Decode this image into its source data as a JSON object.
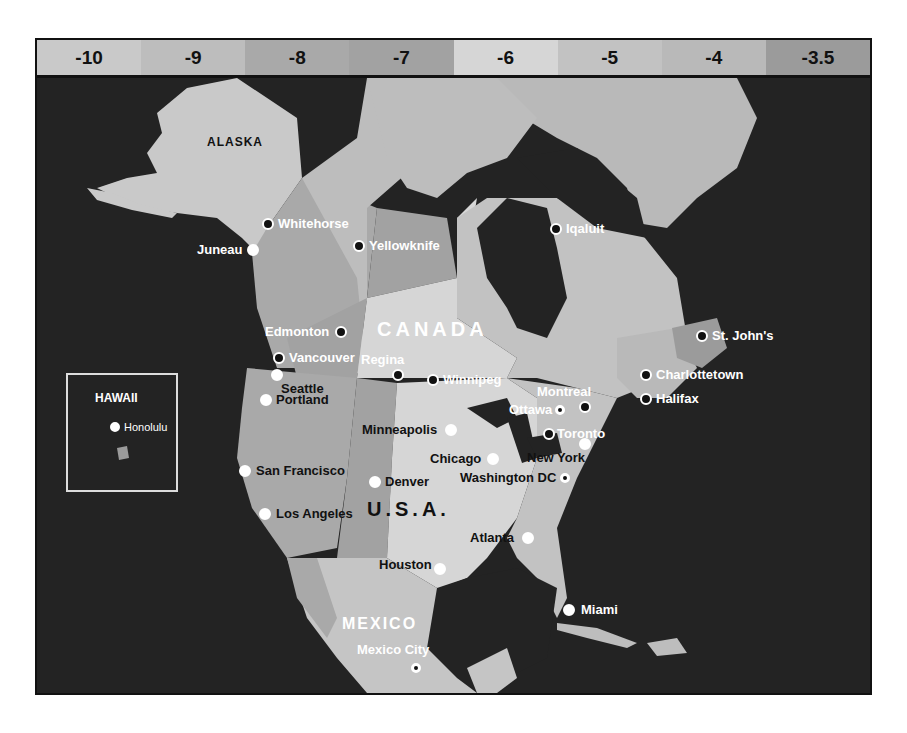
{
  "legend": {
    "title": "UTC offset (hours)",
    "bands": [
      {
        "label": "-10",
        "color": "#c9c9c9"
      },
      {
        "label": "-9",
        "color": "#bdbdbd"
      },
      {
        "label": "-8",
        "color": "#a9a9a9"
      },
      {
        "label": "-7",
        "color": "#a2a2a2"
      },
      {
        "label": "-6",
        "color": "#d6d6d6"
      },
      {
        "label": "-5",
        "color": "#c2c2c2"
      },
      {
        "label": "-4",
        "color": "#b9b9b9"
      },
      {
        "label": "-3.5",
        "color": "#9b9b9b"
      }
    ]
  },
  "colors": {
    "ocean": "#232323",
    "zone_alaska": "#bdbdbd",
    "zone_pacific": "#a9a9a9",
    "zone_mountain": "#a2a2a2",
    "zone_central": "#d6d6d6",
    "zone_central_us": "#c5c5c5",
    "zone_eastern": "#c2c2c2",
    "zone_atlantic": "#b9b9b9",
    "zone_newfoundland": "#9b9b9b"
  },
  "regions": {
    "alaska": "ALASKA",
    "canada": "CANADA",
    "usa": "U.S.A.",
    "mexico": "MEXICO",
    "hawaii": "HAWAII"
  },
  "cities": [
    {
      "name": "Whitehorse"
    },
    {
      "name": "Juneau"
    },
    {
      "name": "Yellowknife"
    },
    {
      "name": "Iqaluit"
    },
    {
      "name": "Edmonton"
    },
    {
      "name": "Vancouver"
    },
    {
      "name": "Regina"
    },
    {
      "name": "Winnipeg"
    },
    {
      "name": "Seattle"
    },
    {
      "name": "Portland"
    },
    {
      "name": "St. John's"
    },
    {
      "name": "Charlottetown"
    },
    {
      "name": "Halifax"
    },
    {
      "name": "Montreal"
    },
    {
      "name": "Ottawa"
    },
    {
      "name": "Toronto"
    },
    {
      "name": "Minneapolis"
    },
    {
      "name": "Chicago"
    },
    {
      "name": "New York"
    },
    {
      "name": "Washington DC"
    },
    {
      "name": "San Francisco"
    },
    {
      "name": "Denver"
    },
    {
      "name": "Los Angeles"
    },
    {
      "name": "Atlanta"
    },
    {
      "name": "Houston"
    },
    {
      "name": "Miami"
    },
    {
      "name": "Mexico City"
    },
    {
      "name": "Honolulu"
    }
  ]
}
